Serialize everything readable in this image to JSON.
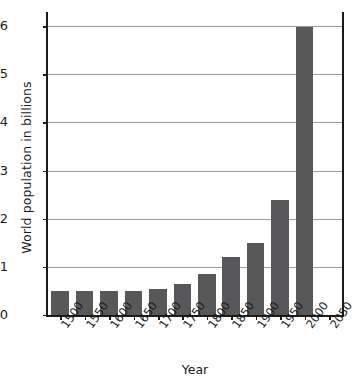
{
  "chart_data": {
    "type": "bar",
    "title": "",
    "xlabel": "Year",
    "ylabel": "World population in billions",
    "categories": [
      "1500",
      "1550",
      "1600",
      "1650",
      "1700",
      "1750",
      "1800",
      "1850",
      "1900",
      "1950",
      "2000",
      "2050"
    ],
    "values": [
      0.5,
      0.5,
      0.5,
      0.5,
      0.55,
      0.65,
      0.85,
      1.2,
      1.5,
      2.4,
      6.0,
      null
    ],
    "ylim": [
      0,
      6.3
    ],
    "yticks": [
      0,
      1,
      2,
      3,
      4,
      5,
      6
    ],
    "ytick_labels": [
      "0",
      "1",
      "2",
      "3",
      "4",
      "5",
      "6"
    ],
    "grid": "horizontal",
    "legend": "none",
    "bar_color": "#58585a",
    "axis_color": "#1a1a1a",
    "grid_color": "#9a9a9a"
  }
}
